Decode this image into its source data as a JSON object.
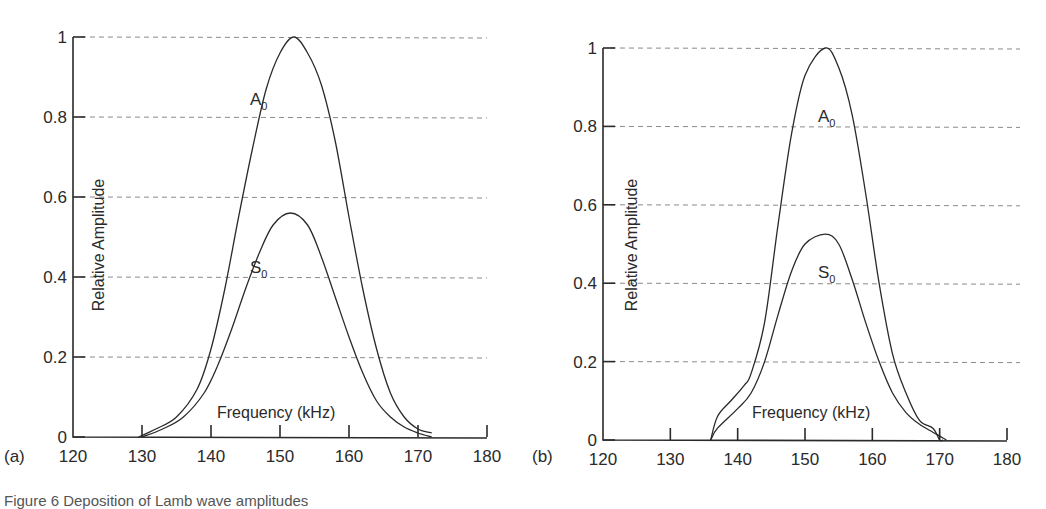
{
  "panels": [
    {
      "label": "(a)"
    },
    {
      "label": "(b)"
    }
  ],
  "caption": "Figure 6   Deposition of Lamb wave amplitudes",
  "chart_data": [
    {
      "type": "line",
      "panel": "(a)",
      "title": "",
      "xlabel": "Frequency (kHz)",
      "ylabel": "Relative Amplitude",
      "xlim": [
        120,
        180
      ],
      "ylim": [
        0,
        1
      ],
      "xticks": [
        "120",
        "130",
        "140",
        "150",
        "160",
        "170",
        "180"
      ],
      "yticks": [
        "0",
        "0.2",
        "0.4",
        "0.6",
        "0.8",
        "1"
      ],
      "grid": "horizontal dashed",
      "series": [
        {
          "name": "A0",
          "x": [
            129.5,
            132,
            135,
            138,
            140,
            142,
            144,
            146,
            148,
            150,
            152,
            154,
            156,
            158,
            160,
            162,
            164,
            166,
            168,
            170,
            172
          ],
          "y": [
            0,
            0.02,
            0.05,
            0.12,
            0.22,
            0.37,
            0.55,
            0.72,
            0.87,
            0.96,
            1.0,
            0.96,
            0.88,
            0.74,
            0.55,
            0.37,
            0.22,
            0.11,
            0.05,
            0.02,
            0.01
          ]
        },
        {
          "name": "S0",
          "x": [
            130,
            133,
            136,
            139,
            141,
            143,
            145,
            147,
            149,
            151.5,
            154,
            156,
            158,
            160,
            162,
            164,
            166,
            168,
            170,
            172
          ],
          "y": [
            0,
            0.02,
            0.05,
            0.11,
            0.18,
            0.27,
            0.37,
            0.46,
            0.53,
            0.56,
            0.53,
            0.45,
            0.35,
            0.25,
            0.16,
            0.09,
            0.05,
            0.025,
            0.01,
            0
          ]
        }
      ],
      "annotations": [
        "A0",
        "S0"
      ]
    },
    {
      "type": "line",
      "panel": "(b)",
      "title": "",
      "xlabel": "Frequency (kHz)",
      "ylabel": "Relative Amplitude",
      "xlim": [
        120,
        180
      ],
      "ylim": [
        0,
        1
      ],
      "xticks": [
        "120",
        "130",
        "140",
        "150",
        "160",
        "170",
        "180"
      ],
      "yticks": [
        "0",
        "0.2",
        "0.4",
        "0.6",
        "0.8",
        "1"
      ],
      "grid": "horizontal dashed",
      "series": [
        {
          "name": "A0",
          "x": [
            136,
            137,
            139,
            141,
            142,
            144,
            146,
            148,
            150,
            153,
            155,
            157,
            159,
            161,
            163,
            165,
            167,
            169,
            170,
            170.5
          ],
          "y": [
            0,
            0.06,
            0.1,
            0.14,
            0.17,
            0.3,
            0.55,
            0.78,
            0.93,
            1.0,
            0.95,
            0.83,
            0.63,
            0.4,
            0.22,
            0.12,
            0.05,
            0.03,
            0,
            0
          ]
        },
        {
          "name": "S0",
          "x": [
            136,
            137,
            140,
            142,
            144,
            146,
            148,
            150,
            153,
            155,
            157,
            159,
            161,
            163,
            165,
            167,
            169,
            170,
            171
          ],
          "y": [
            0,
            0.03,
            0.08,
            0.12,
            0.2,
            0.32,
            0.43,
            0.5,
            0.525,
            0.5,
            0.41,
            0.3,
            0.2,
            0.12,
            0.07,
            0.04,
            0.02,
            0.01,
            0
          ]
        }
      ],
      "annotations": [
        "A0",
        "S0"
      ]
    }
  ]
}
